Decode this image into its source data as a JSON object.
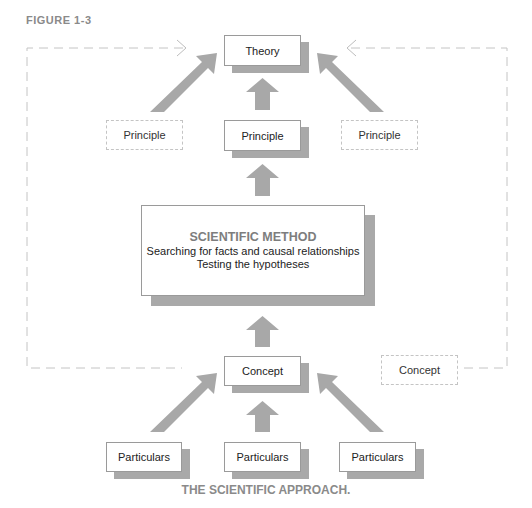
{
  "figure_label": "FIGURE 1-3",
  "caption": "THE SCIENTIFIC APPROACH.",
  "nodes": {
    "theory": "Theory",
    "principle_center": "Principle",
    "principle_left": "Principle",
    "principle_right": "Principle",
    "scientific_method": {
      "title": "SCIENTIFIC METHOD",
      "line1": "Searching for facts and causal relationships",
      "line2": "Testing the hypotheses"
    },
    "concept_center": "Concept",
    "concept_right": "Concept",
    "particulars_left": "Particulars",
    "particulars_center": "Particulars",
    "particulars_right": "Particulars"
  },
  "colors": {
    "arrow": "#a8a8a8",
    "dashed": "#c4c4c4",
    "label": "#8a8a8a"
  }
}
